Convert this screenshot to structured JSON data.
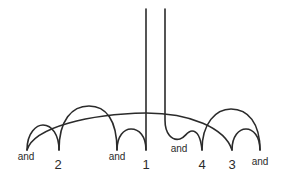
{
  "diagram": {
    "type": "arc-link-diagram",
    "stroke_color": "#2b2b2b",
    "background": "#ffffff",
    "nodes": [
      {
        "id": "n0",
        "label": "and",
        "x": 27,
        "label_x": 26,
        "label_y": 160,
        "kind": "word"
      },
      {
        "id": "n1",
        "label": "2",
        "x": 59,
        "label_x": 58,
        "label_y": 169,
        "kind": "number"
      },
      {
        "id": "n2",
        "label": "and",
        "x": 117,
        "label_x": 117,
        "label_y": 160,
        "kind": "word"
      },
      {
        "id": "n3",
        "label": "1",
        "x": 146,
        "label_x": 146,
        "label_y": 169,
        "kind": "number"
      },
      {
        "id": "n4",
        "label": "and",
        "x": 180,
        "label_x": 179,
        "label_y": 152,
        "kind": "word"
      },
      {
        "id": "n5",
        "label": "4",
        "x": 202,
        "label_x": 202,
        "label_y": 169,
        "kind": "number"
      },
      {
        "id": "n6",
        "label": "3",
        "x": 232,
        "label_x": 232,
        "label_y": 169,
        "kind": "number"
      },
      {
        "id": "n7",
        "label": "and",
        "x": 260,
        "label_x": 260,
        "label_y": 165,
        "kind": "word"
      }
    ],
    "vertical_lines": [
      {
        "from": "top",
        "to": "1",
        "x": 146,
        "y_top": 9
      },
      {
        "from": "top",
        "to": "and→4 bump",
        "x": 165,
        "y_top": 9
      }
    ],
    "arcs": [
      {
        "from": "and",
        "to": "2",
        "size": "small"
      },
      {
        "from": "2",
        "to": "and",
        "size": "large"
      },
      {
        "from": "and",
        "to": "1",
        "size": "small"
      },
      {
        "from": "and",
        "to": "3",
        "size": "spanning",
        "note": "long low arc crossing over 1"
      },
      {
        "from": "and (mid)",
        "to": "4",
        "size": "small bump"
      },
      {
        "from": "4",
        "to": "and",
        "size": "large"
      },
      {
        "from": "3",
        "to": "and",
        "size": "small"
      }
    ]
  }
}
